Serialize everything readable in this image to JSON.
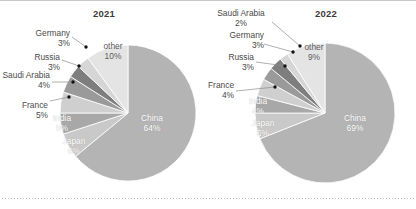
{
  "figure": {
    "background_color": "#ffffff",
    "border_color": "#c9c9c9",
    "dotted_rule_color": "#bdbdbd"
  },
  "chart_data": [
    {
      "type": "pie",
      "title": "2021",
      "xlabel": "",
      "ylabel": "",
      "legend_position": "none",
      "grid": false,
      "start_angle_deg": 0,
      "direction": "clockwise",
      "categories": [
        "China",
        "Japan",
        "India",
        "France",
        "Saudi Arabia",
        "Russia",
        "Germany",
        "other"
      ],
      "values": [
        64,
        6,
        5,
        5,
        4,
        3,
        3,
        10
      ],
      "unit": "%",
      "slices": [
        {
          "label": "China",
          "pct_text": "64%",
          "value": 64,
          "color": "#b4b4b4",
          "label_placement": "inside"
        },
        {
          "label": "Japan",
          "pct_text": "6%",
          "value": 6,
          "color": "#c9c9c9",
          "label_placement": "inside"
        },
        {
          "label": "India",
          "pct_text": "5%",
          "value": 5,
          "color": "#a8a8a8",
          "label_placement": "inside"
        },
        {
          "label": "France",
          "pct_text": "5%",
          "value": 5,
          "color": "#cfcfcf",
          "label_placement": "outside"
        },
        {
          "label": "Saudi Arabia",
          "pct_text": "4%",
          "value": 4,
          "color": "#9a9a9a",
          "label_placement": "outside"
        },
        {
          "label": "Russia",
          "pct_text": "3%",
          "value": 3,
          "color": "#7e7e7e",
          "label_placement": "outside"
        },
        {
          "label": "Germany",
          "pct_text": "3%",
          "value": 3,
          "color": "#d6d6d6",
          "label_placement": "outside"
        },
        {
          "label": "other",
          "pct_text": "10%",
          "value": 10,
          "color": "#e4e4e4",
          "label_placement": "inside"
        }
      ]
    },
    {
      "type": "pie",
      "title": "2022",
      "xlabel": "",
      "ylabel": "",
      "legend_position": "none",
      "grid": false,
      "start_angle_deg": 0,
      "direction": "clockwise",
      "categories": [
        "China",
        "Japan",
        "India",
        "France",
        "Russia",
        "Germany",
        "Saudi Arabia",
        "other"
      ],
      "values": [
        69,
        6,
        4,
        4,
        3,
        3,
        2,
        9
      ],
      "unit": "%",
      "slices": [
        {
          "label": "China",
          "pct_text": "69%",
          "value": 69,
          "color": "#b4b4b4",
          "label_placement": "inside"
        },
        {
          "label": "Japan",
          "pct_text": "6%",
          "value": 6,
          "color": "#c9c9c9",
          "label_placement": "inside"
        },
        {
          "label": "India",
          "pct_text": "4%",
          "value": 4,
          "color": "#a8a8a8",
          "label_placement": "inside"
        },
        {
          "label": "France",
          "pct_text": "4%",
          "value": 4,
          "color": "#cfcfcf",
          "label_placement": "outside"
        },
        {
          "label": "Russia",
          "pct_text": "3%",
          "value": 3,
          "color": "#9a9a9a",
          "label_placement": "outside"
        },
        {
          "label": "Germany",
          "pct_text": "3%",
          "value": 3,
          "color": "#7e7e7e",
          "label_placement": "outside"
        },
        {
          "label": "Saudi Arabia",
          "pct_text": "2%",
          "value": 2,
          "color": "#d6d6d6",
          "label_placement": "outside"
        },
        {
          "label": "other",
          "pct_text": "9%",
          "value": 9,
          "color": "#e4e4e4",
          "label_placement": "inside"
        }
      ]
    }
  ],
  "left_chart": {
    "title": "2021",
    "outside_labels": [
      {
        "name": "Germany",
        "pct": "3%"
      },
      {
        "name": "Russia",
        "pct": "3%"
      },
      {
        "name": "Saudi Arabia",
        "pct": "4%"
      },
      {
        "name": "France",
        "pct": "5%"
      }
    ],
    "inside_labels": [
      {
        "name": "other",
        "pct": "10%"
      },
      {
        "name": "China",
        "pct": "64%"
      },
      {
        "name": "Japan",
        "pct": "6%"
      },
      {
        "name": "India",
        "pct": "5%"
      }
    ]
  },
  "right_chart": {
    "title": "2022",
    "outside_labels": [
      {
        "name": "Saudi Arabia",
        "pct": "2%"
      },
      {
        "name": "Germany",
        "pct": "3%"
      },
      {
        "name": "Russia",
        "pct": "3%"
      },
      {
        "name": "France",
        "pct": "4%"
      }
    ],
    "inside_labels": [
      {
        "name": "other",
        "pct": "9%"
      },
      {
        "name": "China",
        "pct": "69%"
      },
      {
        "name": "Japan",
        "pct": "6%"
      },
      {
        "name": "India",
        "pct": "4%"
      }
    ]
  }
}
